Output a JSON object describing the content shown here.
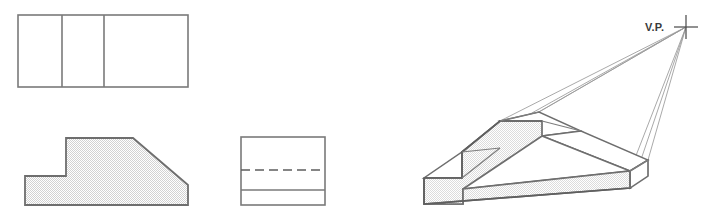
{
  "figure": {
    "background_color": "#ffffff",
    "line_color": "#6b6b6b",
    "dark_line_color": "#555555",
    "thin_line_color": "#9a9a9a",
    "fill_hatch_color": "#e6e6e6",
    "white_face_color": "#ffffff"
  },
  "views": {
    "top_view": {
      "name": "top-view",
      "label": "",
      "outline": "18,15 188,15 188,87 18,87",
      "divider_lines": [
        {
          "x": 62,
          "y1": 15,
          "y2": 87
        },
        {
          "x": 104,
          "y1": 15,
          "y2": 87
        }
      ]
    },
    "front_view": {
      "name": "front-view",
      "label": "",
      "outline": "25,176 66,176 66,138 133,138 188,185 188,205 25,205",
      "filled": true
    },
    "side_view": {
      "name": "side-view",
      "label": "",
      "outline": "241,137 325,137 325,205 241,205",
      "hidden_line": {
        "x1": 241,
        "y1": 170,
        "x2": 325,
        "y2": 170,
        "style": "dashed"
      },
      "solid_line": {
        "x1": 241,
        "y1": 190,
        "x2": 325,
        "y2": 190,
        "style": "solid"
      }
    },
    "perspective_view": {
      "name": "perspective-view",
      "vanishing_point_label": "V.P.",
      "vanishing_point": {
        "x": 686,
        "y": 27
      },
      "front_face": "424,178 462,178 462,152 500,121 542,121 542,136 463,189 463,204 424,204",
      "faces": {
        "front_stepped_face": "424,178 462,178 462,152 500,121 542,121 542,136 463,189 463,204 424,204",
        "bottom_front_band": "424,204 463,204 630,188 630,171",
        "low_top_face": "424,178 462,178 500,148 462,152",
        "upper_top_face": "500,121 542,121 580,112 538,112",
        "slope_top_face": "462,152 500,148 542,136 581,131 630,171 542,136",
        "right_end_face": "630,171 647,161 647,146 630,155"
      }
    }
  },
  "convergence_lines": {
    "name": "perspective-convergence-lines",
    "count": 5,
    "from_vanishing_point": true,
    "targets": [
      {
        "x": 462,
        "y": 152
      },
      {
        "x": 475,
        "y": 149
      },
      {
        "x": 500,
        "y": 121
      },
      {
        "x": 538,
        "y": 112
      },
      {
        "x": 630,
        "y": 171
      },
      {
        "x": 647,
        "y": 161
      },
      {
        "x": 630,
        "y": 188
      }
    ]
  },
  "vp_marker": {
    "name": "vanishing-point-cross",
    "center_x": 686,
    "center_y": 27,
    "arm_length": 12
  }
}
